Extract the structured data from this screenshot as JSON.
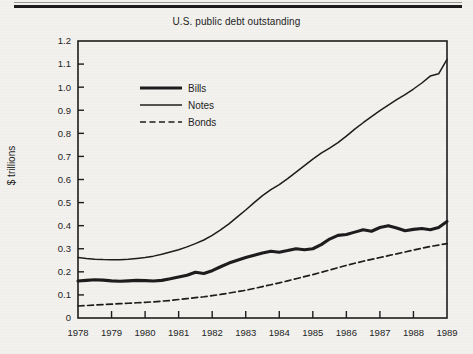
{
  "figure": {
    "title": "U.S. public debt outstanding",
    "ylabel": "$ trillions",
    "background_color": "#f2f1ee",
    "ink_color": "#1c1c1c"
  },
  "legend": {
    "position": "upper-left-inside",
    "entries": [
      {
        "label": "Bills",
        "style": "thick-solid"
      },
      {
        "label": "Notes",
        "style": "thin-solid"
      },
      {
        "label": "Bonds",
        "style": "dashed"
      }
    ]
  },
  "axes": {
    "y_ticks": [
      "0",
      "0.1",
      "0.2",
      "0.3",
      "0.4",
      "0.5",
      "0.6",
      "0.7",
      "0.8",
      "0.9",
      "1.0",
      "1.1",
      "1.2"
    ],
    "x_ticks": [
      "1978",
      "1979",
      "1980",
      "1981",
      "1982",
      "1983",
      "1984",
      "1985",
      "1986",
      "1987",
      "1988",
      "1989"
    ]
  },
  "chart_data": {
    "type": "line",
    "title": "U.S. public debt outstanding",
    "xlabel": "",
    "ylabel": "$ trillions",
    "xlim": [
      1978,
      1989
    ],
    "ylim": [
      0,
      1.2
    ],
    "grid": false,
    "legend_position": "upper left",
    "x": [
      1978,
      1978.25,
      1978.5,
      1978.75,
      1979,
      1979.25,
      1979.5,
      1979.75,
      1980,
      1980.25,
      1980.5,
      1980.75,
      1981,
      1981.25,
      1981.5,
      1981.75,
      1982,
      1982.25,
      1982.5,
      1982.75,
      1983,
      1983.25,
      1983.5,
      1983.75,
      1984,
      1984.25,
      1984.5,
      1984.75,
      1985,
      1985.25,
      1985.5,
      1985.75,
      1986,
      1986.25,
      1986.5,
      1986.75,
      1987,
      1987.25,
      1987.5,
      1987.75,
      1988,
      1988.25,
      1988.5,
      1988.75,
      1989
    ],
    "series": [
      {
        "name": "Bills",
        "style": "thick-solid",
        "values": [
          0.16,
          0.163,
          0.166,
          0.164,
          0.161,
          0.159,
          0.161,
          0.163,
          0.162,
          0.16,
          0.163,
          0.17,
          0.178,
          0.185,
          0.198,
          0.193,
          0.205,
          0.222,
          0.238,
          0.25,
          0.262,
          0.272,
          0.282,
          0.289,
          0.285,
          0.292,
          0.3,
          0.296,
          0.3,
          0.318,
          0.342,
          0.358,
          0.362,
          0.372,
          0.382,
          0.376,
          0.392,
          0.4,
          0.39,
          0.378,
          0.384,
          0.388,
          0.382,
          0.392,
          0.418
        ]
      },
      {
        "name": "Notes",
        "style": "thin-solid",
        "values": [
          0.262,
          0.258,
          0.255,
          0.253,
          0.252,
          0.252,
          0.254,
          0.258,
          0.262,
          0.268,
          0.276,
          0.286,
          0.296,
          0.308,
          0.322,
          0.338,
          0.358,
          0.382,
          0.408,
          0.438,
          0.468,
          0.5,
          0.53,
          0.556,
          0.578,
          0.604,
          0.632,
          0.66,
          0.688,
          0.714,
          0.736,
          0.76,
          0.788,
          0.818,
          0.846,
          0.872,
          0.898,
          0.922,
          0.946,
          0.968,
          0.992,
          1.018,
          1.048,
          1.058,
          1.12
        ]
      },
      {
        "name": "Bonds",
        "style": "dashed",
        "values": [
          0.052,
          0.054,
          0.056,
          0.058,
          0.06,
          0.062,
          0.064,
          0.066,
          0.068,
          0.07,
          0.073,
          0.076,
          0.08,
          0.084,
          0.088,
          0.092,
          0.097,
          0.102,
          0.108,
          0.114,
          0.12,
          0.128,
          0.136,
          0.144,
          0.152,
          0.161,
          0.17,
          0.179,
          0.188,
          0.198,
          0.208,
          0.218,
          0.228,
          0.237,
          0.246,
          0.254,
          0.262,
          0.27,
          0.278,
          0.286,
          0.294,
          0.302,
          0.31,
          0.316,
          0.322
        ]
      }
    ]
  }
}
